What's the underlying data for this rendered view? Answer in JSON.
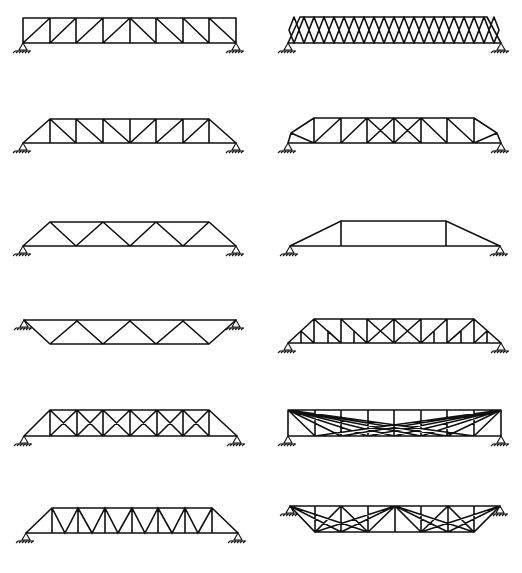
{
  "figure": {
    "layout": {
      "rows": 6,
      "cols": 2
    },
    "colors": {
      "member": "#111111",
      "background": "#ffffff"
    },
    "caption": ""
  },
  "trusses": [
    {
      "id": "t1",
      "label": "Howe-type rectangular truss (diagonals toward center)",
      "panels": 8,
      "supports": "bottom chord ends"
    },
    {
      "id": "t2",
      "label": "Lattice truss with inclined end posts",
      "panels": 20,
      "supports": "bottom chord ends"
    },
    {
      "id": "t3",
      "label": "Pratt truss with inclined end posts",
      "panels": 8,
      "supports": "bottom chord ends"
    },
    {
      "id": "t4",
      "label": "Subdivided / polygonal chord truss with cross-bracing at center",
      "panels": 8,
      "supports": "bottom chord ends"
    },
    {
      "id": "t5",
      "label": "Warren truss with inclined end posts",
      "panels": 8,
      "supports": "bottom chord ends"
    },
    {
      "id": "t6",
      "label": "Trapezoidal truss (Queen-post style)",
      "panels": 3,
      "supports": "bottom chord ends"
    },
    {
      "id": "t7",
      "label": "Inverted Warren truss (deck)",
      "panels": 7,
      "supports": "top chord ends"
    },
    {
      "id": "t8",
      "label": "Baltimore / subdivided Pratt truss",
      "panels": 14,
      "supports": "bottom chord ends"
    },
    {
      "id": "t9",
      "label": "Double-intersection (Whipple) truss",
      "panels": 8,
      "supports": "bottom chord ends"
    },
    {
      "id": "t10",
      "label": "Bollman suspension truss",
      "panels": 8,
      "supports": "bottom chord ends"
    },
    {
      "id": "t11",
      "label": "Warren truss with verticals",
      "panels": 8,
      "supports": "bottom chord ends"
    },
    {
      "id": "t12",
      "label": "Fink deck truss",
      "panels": 8,
      "supports": "top chord ends"
    }
  ]
}
